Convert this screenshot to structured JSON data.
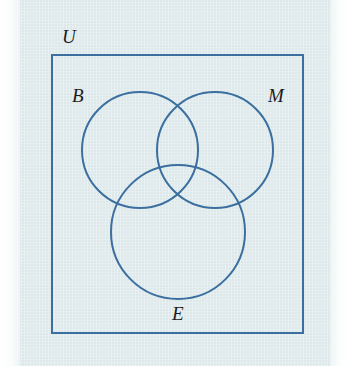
{
  "figure": {
    "type": "venn-diagram",
    "set_count": 3,
    "colors": {
      "background": "#dde8ea",
      "stroke": "#3a6f9f",
      "label_text": "#1c1c1c",
      "page_margin": "#ffffff"
    },
    "stroke_width": 2
  },
  "universe": {
    "label": "U",
    "label_x": 62,
    "label_y": 43,
    "rect": {
      "x": 52,
      "y": 55,
      "width": 251,
      "height": 278
    }
  },
  "sets": [
    {
      "key": "B",
      "label": "B",
      "label_x": 72,
      "label_y": 102,
      "circle": {
        "cx": 140,
        "cy": 150,
        "r": 58
      }
    },
    {
      "key": "M",
      "label": "M",
      "label_x": 268,
      "label_y": 102,
      "circle": {
        "cx": 215,
        "cy": 150,
        "r": 58
      }
    },
    {
      "key": "E",
      "label": "E",
      "label_x": 172,
      "label_y": 320,
      "circle": {
        "cx": 178,
        "cy": 232,
        "r": 67
      }
    }
  ]
}
